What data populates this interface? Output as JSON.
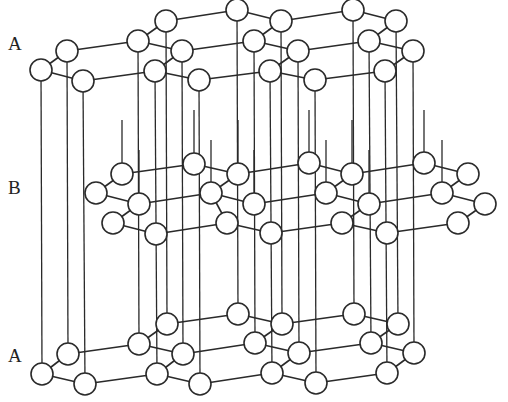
{
  "figure": {
    "labels": [
      {
        "text": "A",
        "x": 8,
        "y": 34
      },
      {
        "text": "B",
        "x": 8,
        "y": 178
      },
      {
        "text": "A",
        "x": 8,
        "y": 346
      }
    ],
    "colors": {
      "line": "#2a2a2a",
      "atom_fill": "#ffffff",
      "background": "#ffffff"
    },
    "atom_radius": 11,
    "layers": [
      {
        "name": "A-top",
        "atoms": [
          [
            41,
            70
          ],
          [
            67,
            51
          ],
          [
            83,
            81
          ],
          [
            138,
            41
          ],
          [
            166,
            21
          ],
          [
            182,
            51
          ],
          [
            155,
            71
          ],
          [
            199,
            80
          ],
          [
            237,
            10
          ],
          [
            281,
            21
          ],
          [
            254,
            41
          ],
          [
            298,
            51
          ],
          [
            270,
            71
          ],
          [
            315,
            80
          ],
          [
            353,
            10
          ],
          [
            396,
            21
          ],
          [
            369,
            41
          ],
          [
            413,
            51
          ],
          [
            385,
            71
          ]
        ],
        "bonds": [
          [
            0,
            1
          ],
          [
            0,
            2
          ],
          [
            1,
            3
          ],
          [
            3,
            4
          ],
          [
            3,
            5
          ],
          [
            4,
            8
          ],
          [
            8,
            9
          ],
          [
            9,
            10
          ],
          [
            9,
            14
          ],
          [
            14,
            15
          ],
          [
            5,
            10
          ],
          [
            10,
            11
          ],
          [
            11,
            16
          ],
          [
            16,
            15
          ],
          [
            16,
            17
          ],
          [
            2,
            6
          ],
          [
            6,
            5
          ],
          [
            6,
            7
          ],
          [
            7,
            12
          ],
          [
            12,
            11
          ],
          [
            12,
            13
          ],
          [
            13,
            18
          ],
          [
            18,
            17
          ]
        ]
      },
      {
        "name": "B-middle",
        "atoms": [
          [
            96,
            193
          ],
          [
            122,
            174
          ],
          [
            139,
            204
          ],
          [
            113,
            223
          ],
          [
            156,
            234
          ],
          [
            194,
            164
          ],
          [
            211,
            193
          ],
          [
            238,
            174
          ],
          [
            254,
            204
          ],
          [
            227,
            223
          ],
          [
            271,
            233
          ],
          [
            309,
            163
          ],
          [
            352,
            174
          ],
          [
            326,
            193
          ],
          [
            369,
            204
          ],
          [
            342,
            223
          ],
          [
            387,
            233
          ],
          [
            424,
            163
          ],
          [
            468,
            174
          ],
          [
            442,
            193
          ],
          [
            485,
            204
          ],
          [
            458,
            223
          ]
        ],
        "bonds": [
          [
            0,
            1
          ],
          [
            0,
            2
          ],
          [
            1,
            5
          ],
          [
            2,
            6
          ],
          [
            2,
            3
          ],
          [
            3,
            4
          ],
          [
            4,
            9
          ],
          [
            5,
            7
          ],
          [
            6,
            7
          ],
          [
            6,
            9
          ],
          [
            7,
            11
          ],
          [
            8,
            6
          ],
          [
            8,
            13
          ],
          [
            9,
            10
          ],
          [
            10,
            15
          ],
          [
            11,
            12
          ],
          [
            12,
            13
          ],
          [
            12,
            17
          ],
          [
            13,
            14
          ],
          [
            14,
            15
          ],
          [
            14,
            19
          ],
          [
            15,
            16
          ],
          [
            16,
            21
          ],
          [
            17,
            18
          ],
          [
            18,
            19
          ],
          [
            19,
            20
          ],
          [
            20,
            21
          ]
        ]
      },
      {
        "name": "A-bottom",
        "atoms": [
          [
            42,
            374
          ],
          [
            68,
            354
          ],
          [
            85,
            384
          ],
          [
            139,
            344
          ],
          [
            167,
            324
          ],
          [
            183,
            354
          ],
          [
            157,
            374
          ],
          [
            200,
            384
          ],
          [
            238,
            314
          ],
          [
            282,
            324
          ],
          [
            255,
            343
          ],
          [
            299,
            353
          ],
          [
            272,
            373
          ],
          [
            316,
            383
          ],
          [
            354,
            314
          ],
          [
            398,
            324
          ],
          [
            371,
            343
          ],
          [
            414,
            353
          ],
          [
            387,
            373
          ]
        ],
        "bonds": [
          [
            0,
            1
          ],
          [
            0,
            2
          ],
          [
            1,
            3
          ],
          [
            3,
            4
          ],
          [
            3,
            5
          ],
          [
            4,
            8
          ],
          [
            8,
            9
          ],
          [
            9,
            10
          ],
          [
            9,
            14
          ],
          [
            14,
            15
          ],
          [
            5,
            10
          ],
          [
            10,
            11
          ],
          [
            11,
            16
          ],
          [
            16,
            15
          ],
          [
            16,
            17
          ],
          [
            2,
            6
          ],
          [
            6,
            5
          ],
          [
            6,
            7
          ],
          [
            7,
            12
          ],
          [
            12,
            11
          ],
          [
            12,
            13
          ],
          [
            13,
            18
          ],
          [
            18,
            17
          ]
        ]
      }
    ],
    "vertical_lines": [
      [
        41,
        70,
        42,
        374
      ],
      [
        67,
        51,
        68,
        354
      ],
      [
        83,
        81,
        85,
        384
      ],
      [
        138,
        41,
        139,
        344
      ],
      [
        155,
        71,
        157,
        374
      ],
      [
        166,
        21,
        167,
        324
      ],
      [
        182,
        51,
        183,
        354
      ],
      [
        199,
        80,
        200,
        384
      ],
      [
        237,
        10,
        238,
        314
      ],
      [
        254,
        41,
        255,
        343
      ],
      [
        270,
        71,
        272,
        373
      ],
      [
        281,
        21,
        282,
        324
      ],
      [
        298,
        51,
        299,
        353
      ],
      [
        315,
        80,
        316,
        383
      ],
      [
        353,
        10,
        354,
        314
      ],
      [
        369,
        41,
        371,
        343
      ],
      [
        385,
        71,
        387,
        373
      ],
      [
        396,
        21,
        398,
        324
      ],
      [
        413,
        51,
        414,
        353
      ],
      [
        122,
        174,
        122,
        120
      ],
      [
        139,
        204,
        139,
        150
      ],
      [
        194,
        164,
        194,
        110
      ],
      [
        211,
        193,
        211,
        140
      ],
      [
        238,
        174,
        238,
        120
      ],
      [
        254,
        204,
        254,
        150
      ],
      [
        309,
        163,
        309,
        110
      ],
      [
        326,
        193,
        326,
        140
      ],
      [
        352,
        174,
        352,
        120
      ],
      [
        369,
        204,
        369,
        150
      ],
      [
        424,
        163,
        424,
        110
      ],
      [
        442,
        193,
        442,
        140
      ]
    ]
  }
}
